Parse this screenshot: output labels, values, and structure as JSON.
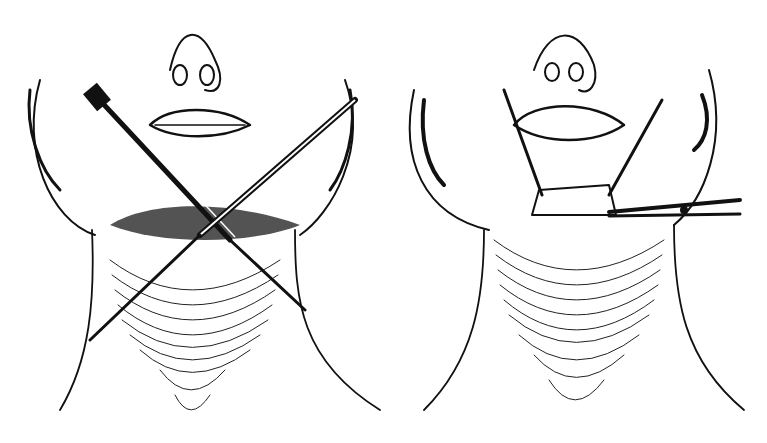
{
  "figure": {
    "panels": [
      {
        "id": "left",
        "description": "Neck with crossed instruments (forceps and probe) inserted through submental incision"
      },
      {
        "id": "right",
        "description": "Neck with incision retracted by two hooks and a clamp/scissors on the right side"
      }
    ],
    "colors": {
      "ink": "#111111",
      "paper": "#ffffff"
    }
  }
}
